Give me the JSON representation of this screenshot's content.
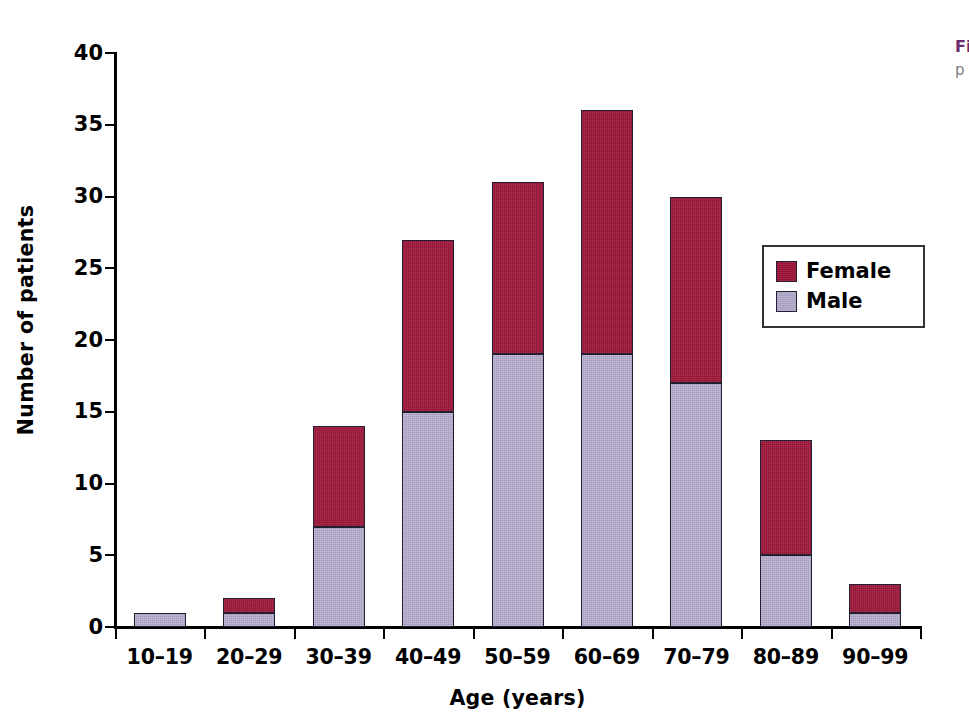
{
  "chart_data": {
    "type": "bar",
    "subtype": "stacked-vertical",
    "title": "",
    "xlabel": "Age (years)",
    "ylabel": "Number of patients",
    "categories": [
      "10–19",
      "20–29",
      "30–39",
      "40–49",
      "50–59",
      "60–69",
      "70–79",
      "80–89",
      "90–99"
    ],
    "series": [
      {
        "name": "Male",
        "color": "#aea4c7",
        "values": [
          1,
          1,
          7,
          15,
          19,
          19,
          17,
          5,
          1
        ]
      },
      {
        "name": "Female",
        "color": "#9d1739",
        "values": [
          0,
          1,
          7,
          12,
          12,
          17,
          13,
          8,
          2
        ]
      }
    ],
    "stack_order": [
      "Male",
      "Female"
    ],
    "totals": [
      1,
      2,
      14,
      27,
      31,
      36,
      30,
      13,
      3
    ],
    "ylim": [
      0,
      40
    ],
    "yticks": [
      0,
      5,
      10,
      15,
      20,
      25,
      30,
      35,
      40
    ],
    "ytick_labels": [
      "0",
      "5",
      "10",
      "15",
      "20",
      "25",
      "30",
      "35",
      "40"
    ],
    "grid": false,
    "legend_position": "inside-upper-right",
    "legend_entries": [
      "Female",
      "Male"
    ]
  },
  "legend": {
    "female_label": "Female",
    "male_label": "Male"
  },
  "caption": {
    "title": "Figure",
    "body": "p"
  }
}
